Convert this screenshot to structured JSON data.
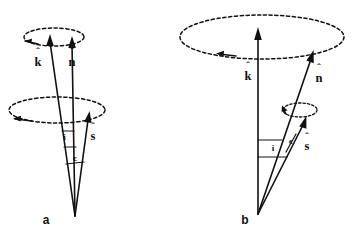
{
  "figure": {
    "type": "vector-geometry-diagram",
    "background_color": "#ffffff",
    "ink_color": "#111111",
    "panels": [
      {
        "id": "a",
        "label": "a",
        "label_x": 46,
        "label_y": 222,
        "apex_x": 75,
        "apex_y": 216,
        "vectors": [
          {
            "name": "k-hat",
            "symbol": "k",
            "label": "k̂",
            "label_text": "k",
            "tip_x": 50,
            "tip_y": 36,
            "label_x": 38,
            "label_y": 66
          },
          {
            "name": "n-hat",
            "symbol": "n",
            "label": "n̂",
            "label_text": "n",
            "tip_x": 72,
            "tip_y": 38,
            "label_x": 72,
            "label_y": 66
          },
          {
            "name": "s-hat",
            "symbol": "s",
            "label": "ŝ",
            "label_text": "s",
            "tip_x": 91,
            "tip_y": 112,
            "label_x": 92,
            "label_y": 137
          }
        ],
        "angles": [
          {
            "name": "inclination",
            "label": "i",
            "label_x": 64,
            "label_y": 139
          },
          {
            "name": "epsilon",
            "label": "ϵ",
            "label_x": 74,
            "label_y": 160
          }
        ],
        "circles": [
          {
            "name": "upper-precession-circle",
            "cx": 54,
            "cy": 37,
            "rx": 30,
            "ry": 9,
            "rotation_arrow": "counterclockwise",
            "arrow_side": "left"
          },
          {
            "name": "lower-precession-circle",
            "cx": 57,
            "cy": 110,
            "rx": 48,
            "ry": 13,
            "rotation_arrow": "counterclockwise",
            "arrow_side": "left"
          }
        ]
      },
      {
        "id": "b",
        "label": "b",
        "label_x": 245,
        "label_y": 222,
        "apex_x": 258,
        "apex_y": 214,
        "vectors": [
          {
            "name": "k-hat",
            "symbol": "k",
            "label": "k̂",
            "label_text": "k",
            "tip_x": 258,
            "tip_y": 29,
            "label_x": 248,
            "label_y": 77
          },
          {
            "name": "n-hat",
            "symbol": "n",
            "label": "n̂",
            "label_text": "n",
            "tip_x": 313,
            "tip_y": 51,
            "label_x": 318,
            "label_y": 79
          },
          {
            "name": "s-hat",
            "symbol": "s",
            "label": "ŝ",
            "label_text": "s",
            "tip_x": 306,
            "tip_y": 117,
            "label_x": 305,
            "label_y": 147
          }
        ],
        "angles": [
          {
            "name": "inclination",
            "label": "i",
            "label_x": 273,
            "label_y": 148
          },
          {
            "name": "epsilon",
            "label": "ϵ",
            "label_x": 291,
            "label_y": 142
          }
        ],
        "circles": [
          {
            "name": "large-precession-circle",
            "cx": 262,
            "cy": 37,
            "rx": 82,
            "ry": 22,
            "rotation_arrow": "counterclockwise",
            "arrow_side": "bottom-left"
          },
          {
            "name": "small-spin-circle",
            "cx": 300,
            "cy": 110,
            "rx": 17,
            "ry": 7,
            "rotation_arrow": "counterclockwise",
            "arrow_side": "left"
          }
        ]
      }
    ],
    "symbols_legend": {
      "k_hat": "k̂",
      "n_hat": "n̂",
      "s_hat": "ŝ",
      "inclination": "i",
      "epsilon": "ϵ"
    }
  }
}
